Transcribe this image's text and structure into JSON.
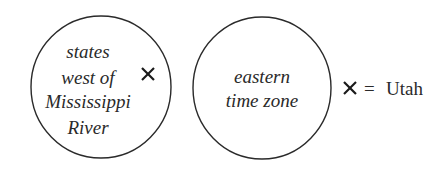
{
  "diagram": {
    "type": "venn",
    "sets": [
      {
        "name": "states-west-of-mississippi",
        "label_lines": [
          "states",
          "west of",
          "Mississippi",
          "River"
        ]
      },
      {
        "name": "eastern-time-zone",
        "label_lines": [
          "eastern",
          "time zone"
        ]
      }
    ],
    "marker": {
      "symbol": "×",
      "in_set": "states-west-of-mississippi"
    },
    "legend": {
      "symbol": "×",
      "equals": "=",
      "text": "Utah"
    },
    "colors": {
      "stroke": "#2a2a2a",
      "background": "#ffffff"
    }
  }
}
